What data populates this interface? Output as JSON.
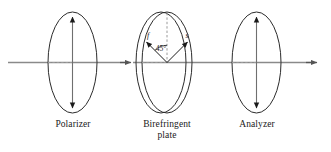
{
  "figure": {
    "type": "optics-diagram",
    "background_color": "#ffffff",
    "stroke_color": "#2b2b2b",
    "beam_color": "#808080",
    "width": 331,
    "height": 152
  },
  "captions": {
    "polarizer": "Polarizer",
    "plate": "Birefringent\nplate",
    "analyzer": "Analyzer"
  },
  "elements": [
    {
      "name": "polarizer",
      "shape": "ellipse",
      "cx": 72.5,
      "cy": 62.5,
      "rx": 24.5,
      "ry": 50.5,
      "transmission_axis": "vertical",
      "axis_arrow": "double-headed"
    },
    {
      "name": "birefringent-plate",
      "shape": "double-ellipse",
      "cx": 167,
      "cy": 62.5,
      "rx": 25,
      "ry": 50.5,
      "thickness_offset": 6,
      "fast_axis_label": "f",
      "slow_axis_label": "s",
      "angle_label": "45°",
      "fast_axis_angle_deg": 135,
      "slow_axis_angle_deg": 45
    },
    {
      "name": "analyzer",
      "shape": "ellipse",
      "cx": 256.5,
      "cy": 62.5,
      "rx": 24.5,
      "ry": 50.5,
      "transmission_axis": "vertical",
      "axis_arrow": "double-headed"
    }
  ],
  "beam": {
    "name": "optical-beam",
    "y": 62.5,
    "x_start": 8,
    "x_end": 318,
    "arrowheads_at_x": [
      131,
      317
    ],
    "dashed_segments": [
      {
        "x1": 48,
        "x2": 72
      },
      {
        "x1": 142,
        "x2": 167
      },
      {
        "x1": 232,
        "x2": 256
      }
    ]
  }
}
